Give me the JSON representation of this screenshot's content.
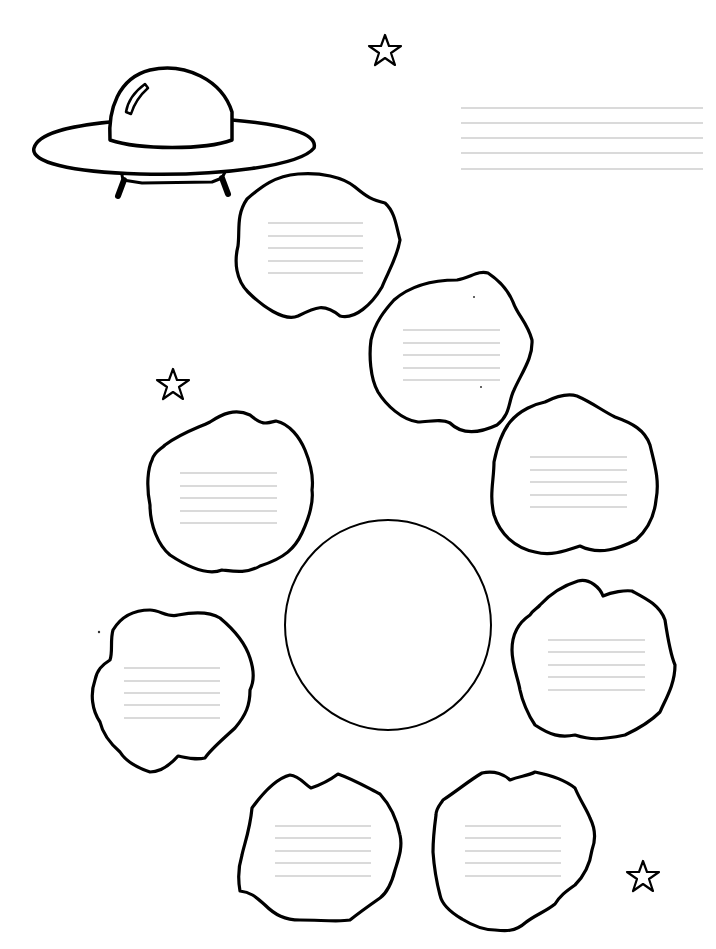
{
  "worksheet": {
    "width": 716,
    "height": 949,
    "background": "#ffffff",
    "ink_color": "#000000",
    "rule_color": "#b5b5b5",
    "title_lines": {
      "x1": 461,
      "x2": 703,
      "ys": [
        108,
        123,
        138,
        153,
        169
      ]
    },
    "ufo": {
      "cx": 175,
      "cy": 145
    },
    "stars": [
      {
        "name": "star-top",
        "cx": 385,
        "cy": 50,
        "r": 16
      },
      {
        "name": "star-left",
        "cx": 173,
        "cy": 384,
        "r": 16
      },
      {
        "name": "star-bottom-right",
        "cx": 643,
        "cy": 876,
        "r": 16
      }
    ],
    "center_circle": {
      "cx": 388,
      "cy": 625,
      "rx": 103,
      "ry": 105
    },
    "blobs": [
      {
        "name": "blob-1",
        "lines": {
          "x1": 268,
          "x2": 363,
          "ys": [
            223,
            236,
            248,
            261,
            273
          ]
        },
        "path": "M247,199 C262,186 275,176 298,174 C320,172 343,177 355,187 C367,197 372,200 385,203 C395,212 396,225 400,240 C397,258 388,272 382,287 C372,304 355,320 340,316 C324,303 316,307 298,316 C284,322 262,306 248,292 C236,280 234,262 238,246 C240,230 236,215 247,199 Z"
      },
      {
        "name": "blob-2",
        "lines": {
          "x1": 403,
          "x2": 500,
          "ys": [
            330,
            343,
            355,
            368,
            380
          ]
        },
        "path": "M394,300 C410,286 430,280 457,280 C470,278 478,270 488,273 C500,281 508,290 513,302 C518,316 527,322 532,340 C533,358 522,372 514,390 C508,402 511,414 497,425 C482,432 463,436 450,423 C441,418 429,422 418,422 C402,420 386,405 378,392 C370,378 369,355 371,340 C375,322 385,310 394,300 Z"
      },
      {
        "name": "blob-3",
        "lines": {
          "x1": 530,
          "x2": 627,
          "ys": [
            457,
            470,
            482,
            495,
            507
          ]
        },
        "path": "M510,422 C520,410 535,404 545,402 C553,398 567,393 577,396 C593,403 601,410 615,417 C632,423 645,430 650,445 C654,462 660,480 656,500 C654,520 645,532 636,540 C620,548 600,556 580,546 C562,552 550,556 535,552 C515,548 500,534 494,515 C489,495 494,480 494,462 C497,447 502,432 510,422 Z"
      },
      {
        "name": "blob-4",
        "lines": {
          "x1": 180,
          "x2": 277,
          "ys": [
            473,
            486,
            498,
            511,
            523
          ]
        },
        "path": "M165,445 C183,432 198,428 210,422 C222,414 235,408 250,415 C262,425 265,424 276,421 C290,424 300,438 305,450 C310,462 314,475 312,490 C314,505 308,520 302,533 C295,548 285,558 260,566 C247,574 232,571 222,570 C207,576 188,567 170,555 C158,545 150,525 150,505 C146,485 148,468 152,460 C154,452 160,450 165,445 Z"
      },
      {
        "name": "blob-5",
        "lines": {
          "x1": 124,
          "x2": 220,
          "ys": [
            668,
            681,
            693,
            705,
            718
          ]
        },
        "path": "M113,630 C122,615 135,610 150,610 C160,610 168,618 178,615 C194,612 210,612 220,618 C232,628 245,642 250,658 C254,670 255,680 250,690 C250,705 246,715 235,728 C222,740 210,750 205,758 C195,760 188,758 178,756 C170,765 160,772 150,772 C135,767 125,760 120,752 C112,745 103,735 100,722 C92,710 90,694 95,680 C97,670 102,665 110,660 C113,652 110,640 113,630 Z"
      },
      {
        "name": "blob-6",
        "lines": {
          "x1": 548,
          "x2": 645,
          "ys": [
            640,
            652,
            665,
            677,
            690
          ]
        },
        "path": "M540,605 C552,592 565,585 578,581 C590,578 600,588 603,596 C612,592 625,590 632,591 C645,598 660,605 665,620 C668,640 672,658 675,665 C675,685 665,700 660,712 C650,722 640,728 625,735 C600,740 590,740 575,735 C560,738 550,735 535,725 C528,715 522,700 520,690 C518,678 512,665 512,650 C512,638 515,625 530,615 C533,610 538,608 540,605 Z"
      },
      {
        "name": "blob-7",
        "lines": {
          "x1": 275,
          "x2": 371,
          "ys": [
            826,
            838,
            851,
            863,
            876
          ]
        },
        "path": "M252,808 C265,790 278,778 290,775 C300,776 305,785 311,788 C320,785 330,780 338,774 C355,780 368,788 380,794 C390,805 397,820 400,835 C403,848 398,860 395,870 C392,882 388,892 380,898 C370,905 360,912 350,920 C340,922 320,920 300,920 C285,920 275,915 265,905 C255,896 250,892 240,891 C238,880 238,868 242,855 C244,845 250,830 252,808 Z"
      },
      {
        "name": "blob-8",
        "lines": {
          "x1": 465,
          "x2": 561,
          "ys": [
            826,
            838,
            851,
            863,
            876
          ]
        },
        "path": "M443,800 C458,790 470,780 482,773 C495,770 505,775 510,780 C520,776 528,776 535,772 C550,775 565,780 575,788 C580,800 587,810 590,818 C596,830 595,842 592,850 C590,864 584,876 575,885 C565,892 560,896 555,904 C545,912 535,915 525,923 C515,932 505,931 495,930 C482,930 470,924 462,919 C450,912 442,905 440,895 C436,880 434,866 433,852 C433,840 434,830 436,815 C436,808 440,805 443,800 Z"
      }
    ]
  }
}
